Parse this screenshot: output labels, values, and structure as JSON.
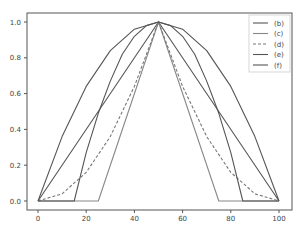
{
  "chart_data": {
    "type": "line",
    "title": "",
    "xlabel": "",
    "ylabel": "",
    "xlim": [
      -5,
      105
    ],
    "ylim": [
      -0.05,
      1.05
    ],
    "x_ticks": [
      0,
      20,
      40,
      60,
      80,
      100
    ],
    "x_tick_labels": [
      "0",
      "20",
      "40",
      "60",
      "80",
      "100"
    ],
    "y_ticks": [
      0.0,
      0.2,
      0.4,
      0.6,
      0.8,
      1.0
    ],
    "y_tick_labels": [
      "0.0",
      "0.2",
      "0.4",
      "0.6",
      "0.8",
      "1.0"
    ],
    "grid": false,
    "legend_position": "upper right",
    "series": [
      {
        "name": "(b)",
        "style": "solid",
        "color": "#555555",
        "x": [
          0,
          50,
          100
        ],
        "y": [
          0,
          1.0,
          0
        ]
      },
      {
        "name": "(c)",
        "style": "solid",
        "color": "#888888",
        "x": [
          0,
          25,
          50,
          75,
          100
        ],
        "y": [
          0,
          0,
          1.0,
          0,
          0
        ]
      },
      {
        "name": "(d)",
        "style": "dashed",
        "color": "#777777",
        "x": [
          0,
          10,
          20,
          30,
          40,
          50,
          60,
          70,
          80,
          90,
          100
        ],
        "y": [
          0,
          0.04,
          0.16,
          0.36,
          0.64,
          1.0,
          0.64,
          0.36,
          0.16,
          0.04,
          0
        ]
      },
      {
        "name": "(e)",
        "style": "solid",
        "color": "#555555",
        "x": [
          0,
          15,
          20,
          25,
          30,
          35,
          40,
          45,
          50,
          55,
          60,
          65,
          70,
          75,
          80,
          85,
          100
        ],
        "y": [
          0,
          0,
          0.27,
          0.49,
          0.67,
          0.82,
          0.92,
          0.98,
          1.0,
          0.98,
          0.92,
          0.82,
          0.67,
          0.49,
          0.27,
          0,
          0
        ]
      },
      {
        "name": "(f)",
        "style": "solid",
        "color": "#555555",
        "x": [
          0,
          10,
          20,
          30,
          40,
          50,
          60,
          70,
          80,
          90,
          100
        ],
        "y": [
          0,
          0.36,
          0.64,
          0.84,
          0.96,
          1.0,
          0.96,
          0.84,
          0.64,
          0.36,
          0
        ]
      }
    ]
  }
}
